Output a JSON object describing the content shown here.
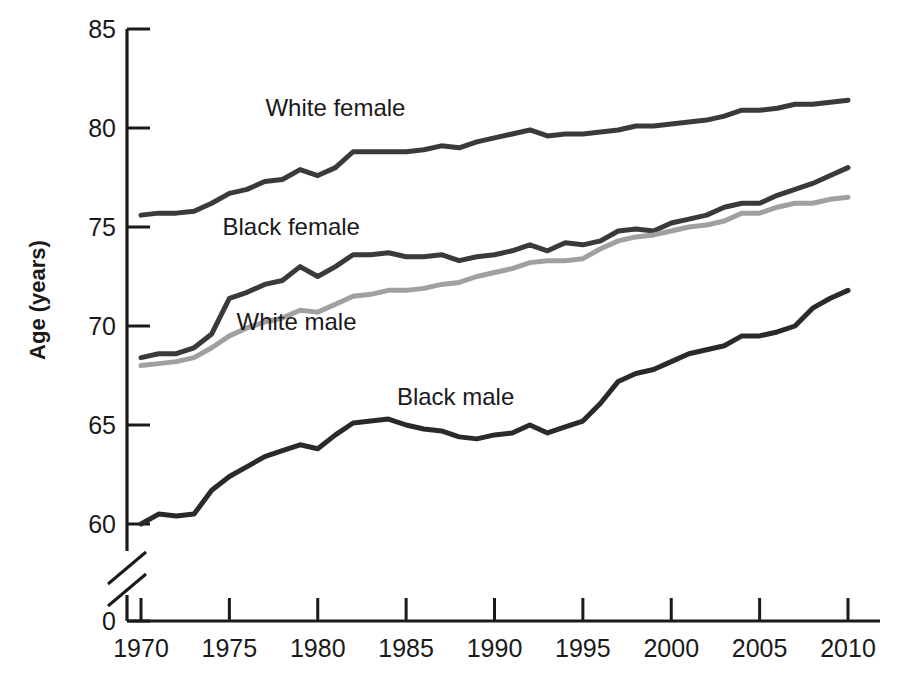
{
  "chart_data": {
    "type": "line",
    "title": "",
    "subtitle": "",
    "xlabel": "",
    "ylabel": "Age (years)",
    "xlim": [
      1970,
      2010
    ],
    "ylim": [
      58,
      85
    ],
    "y_axis_break": true,
    "y_axis_break_note": "axis broken between 0 and 60",
    "grid": false,
    "legend_position": "inline-labels",
    "x_ticks": [
      1970,
      1975,
      1980,
      1985,
      1990,
      1995,
      2000,
      2005,
      2010
    ],
    "x_tick_labels": [
      "1970",
      "1975",
      "1980",
      "1985",
      "1990",
      "1995",
      "2000",
      "2005",
      "2010"
    ],
    "y_ticks": [
      0,
      60,
      65,
      70,
      75,
      80,
      85
    ],
    "y_tick_labels": [
      "0",
      "60",
      "65",
      "70",
      "75",
      "80",
      "85"
    ],
    "x": [
      1970,
      1971,
      1972,
      1973,
      1974,
      1975,
      1976,
      1977,
      1978,
      1979,
      1980,
      1981,
      1982,
      1983,
      1984,
      1985,
      1986,
      1987,
      1988,
      1989,
      1990,
      1991,
      1992,
      1993,
      1994,
      1995,
      1996,
      1997,
      1998,
      1999,
      2000,
      2001,
      2002,
      2003,
      2004,
      2005,
      2006,
      2007,
      2008,
      2009,
      2010
    ],
    "series": [
      {
        "name": "White female",
        "color": "#3a3a3a",
        "label_x": 1981.0,
        "label_y": 80.6,
        "values": [
          75.6,
          75.7,
          75.7,
          75.8,
          76.2,
          76.7,
          76.9,
          77.3,
          77.4,
          77.9,
          77.6,
          78.0,
          78.8,
          78.8,
          78.8,
          78.8,
          78.9,
          79.1,
          79.0,
          79.3,
          79.5,
          79.7,
          79.9,
          79.6,
          79.7,
          79.7,
          79.8,
          79.9,
          80.1,
          80.1,
          80.2,
          80.3,
          80.4,
          80.6,
          80.9,
          80.9,
          81.0,
          81.2,
          81.2,
          81.3,
          81.4
        ]
      },
      {
        "name": "Black female",
        "color": "#3a3a3a",
        "label_x": 1978.5,
        "label_y": 74.6,
        "values": [
          68.4,
          68.6,
          68.6,
          68.9,
          69.6,
          71.4,
          71.7,
          72.1,
          72.3,
          73.0,
          72.5,
          73.0,
          73.6,
          73.6,
          73.7,
          73.5,
          73.5,
          73.6,
          73.3,
          73.5,
          73.6,
          73.8,
          74.1,
          73.8,
          74.2,
          74.1,
          74.3,
          74.8,
          74.9,
          74.8,
          75.2,
          75.4,
          75.6,
          76.0,
          76.2,
          76.2,
          76.6,
          76.9,
          77.2,
          77.6,
          78.0
        ]
      },
      {
        "name": "White male",
        "color": "#a0a0a0",
        "label_x": 1978.8,
        "label_y": 69.8,
        "values": [
          68.0,
          68.1,
          68.2,
          68.4,
          68.9,
          69.5,
          69.9,
          70.2,
          70.4,
          70.8,
          70.7,
          71.1,
          71.5,
          71.6,
          71.8,
          71.8,
          71.9,
          72.1,
          72.2,
          72.5,
          72.7,
          72.9,
          73.2,
          73.3,
          73.3,
          73.4,
          73.9,
          74.3,
          74.5,
          74.6,
          74.8,
          75.0,
          75.1,
          75.3,
          75.7,
          75.7,
          76.0,
          76.2,
          76.2,
          76.4,
          76.5
        ]
      },
      {
        "name": "Black male",
        "color": "#2a2a2a",
        "label_x": 1987.8,
        "label_y": 66.0,
        "values": [
          60.0,
          60.5,
          60.4,
          60.5,
          61.7,
          62.4,
          62.9,
          63.4,
          63.7,
          64.0,
          63.8,
          64.5,
          65.1,
          65.2,
          65.3,
          65.0,
          64.8,
          64.7,
          64.4,
          64.3,
          64.5,
          64.6,
          65.0,
          64.6,
          64.9,
          65.2,
          66.1,
          67.2,
          67.6,
          67.8,
          68.2,
          68.6,
          68.8,
          69.0,
          69.5,
          69.5,
          69.7,
          70.0,
          70.9,
          71.4,
          71.8
        ]
      }
    ]
  },
  "axis": {
    "y_title": "Age (years)",
    "x_title": ""
  }
}
